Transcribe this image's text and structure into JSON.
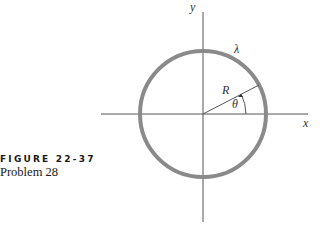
{
  "caption": {
    "label": "FIGURE 22-37",
    "subtitle": "Problem 28"
  },
  "diagram": {
    "labels": {
      "y_axis": "y",
      "x_axis": "x",
      "charge_density": "λ",
      "radius": "R",
      "angle": "θ"
    },
    "colors": {
      "ring": "#8a8a8a",
      "axes": "#555555"
    }
  }
}
